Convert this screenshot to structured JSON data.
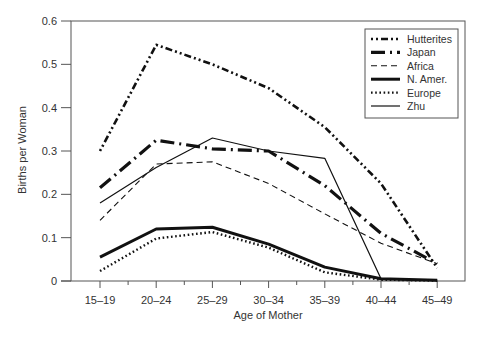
{
  "chart_data": {
    "type": "line",
    "title": "",
    "xlabel": "Age of Mother",
    "ylabel": "Births per Woman",
    "categories": [
      "15–19",
      "20–24",
      "25–29",
      "30–34",
      "35–39",
      "40–44",
      "45–49"
    ],
    "ylim": [
      0,
      0.6
    ],
    "yticks": [
      0,
      0.1,
      0.2,
      0.3,
      0.4,
      0.5,
      0.6
    ],
    "ytick_labels": [
      "0",
      "0.1",
      "0.2",
      "0.3",
      "0.4",
      "0.5",
      "0.6"
    ],
    "grid": false,
    "legend_position": "upper right",
    "series": [
      {
        "name": "Hutterites",
        "style": "dash-dot-dot",
        "values": [
          0.3,
          0.545,
          0.5,
          0.445,
          0.355,
          0.225,
          0.03
        ]
      },
      {
        "name": "Japan",
        "style": "thick dash-dot",
        "values": [
          0.215,
          0.325,
          0.305,
          0.3,
          0.22,
          0.11,
          0.04
        ]
      },
      {
        "name": "Africa",
        "style": "dashed",
        "values": [
          0.14,
          0.27,
          0.275,
          0.225,
          0.155,
          0.087,
          0.04
        ]
      },
      {
        "name": "N. Amer.",
        "style": "thick solid",
        "values": [
          0.055,
          0.12,
          0.124,
          0.085,
          0.032,
          0.005,
          0.002
        ]
      },
      {
        "name": "Europe",
        "style": "dotted",
        "values": [
          0.023,
          0.098,
          0.113,
          0.077,
          0.02,
          0.003,
          0.001
        ]
      },
      {
        "name": "Zhu",
        "style": "thin solid",
        "values": [
          0.18,
          0.262,
          0.33,
          0.3,
          0.283,
          0.005,
          0.001
        ]
      }
    ]
  }
}
